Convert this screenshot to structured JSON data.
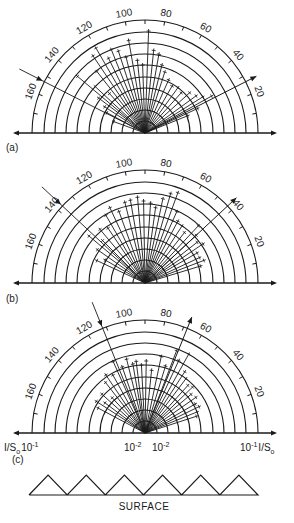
{
  "figure": {
    "panels": [
      {
        "id": "a",
        "label": "(a)",
        "center": [
          145,
          133
        ],
        "incident_angle_deg": 153,
        "specular_angle_deg": 27,
        "rays": [
          [
            160,
            35
          ],
          [
            152,
            45
          ],
          [
            147,
            50
          ],
          [
            143,
            60
          ],
          [
            140,
            90
          ],
          [
            137,
            70
          ],
          [
            132,
            55
          ],
          [
            128,
            80
          ],
          [
            124,
            95
          ],
          [
            120,
            100
          ],
          [
            116,
            85
          ],
          [
            112,
            92
          ],
          [
            108,
            88
          ],
          [
            104,
            80
          ],
          [
            100,
            96
          ],
          [
            96,
            75
          ],
          [
            92,
            70
          ],
          [
            88,
            104
          ],
          [
            84,
            85
          ],
          [
            80,
            82
          ],
          [
            76,
            72
          ],
          [
            72,
            66
          ],
          [
            66,
            60
          ],
          [
            60,
            56
          ],
          [
            54,
            58
          ],
          [
            48,
            56
          ],
          [
            42,
            62
          ],
          [
            36,
            65
          ],
          [
            32,
            70
          ],
          [
            29,
            78
          ],
          [
            25,
            60
          ],
          [
            22,
            48
          ]
        ]
      },
      {
        "id": "b",
        "label": "(b)",
        "center": [
          145,
          283
        ],
        "incident_angle_deg": 137,
        "specular_angle_deg": 43,
        "rays": [
          [
            155,
            55
          ],
          [
            150,
            48
          ],
          [
            145,
            60
          ],
          [
            140,
            75
          ],
          [
            135,
            62
          ],
          [
            130,
            72
          ],
          [
            124,
            68
          ],
          [
            120,
            80
          ],
          [
            115,
            85
          ],
          [
            110,
            78
          ],
          [
            104,
            85
          ],
          [
            100,
            86
          ],
          [
            95,
            88
          ],
          [
            91,
            84
          ],
          [
            86,
            82
          ],
          [
            82,
            78
          ],
          [
            78,
            88
          ],
          [
            74,
            95
          ],
          [
            70,
            98
          ],
          [
            66,
            80
          ],
          [
            62,
            72
          ],
          [
            57,
            70
          ],
          [
            52,
            66
          ],
          [
            47,
            80
          ],
          [
            43,
            72
          ],
          [
            38,
            68
          ],
          [
            34,
            72
          ],
          [
            30,
            62
          ],
          [
            25,
            62
          ],
          [
            21,
            65
          ],
          [
            17,
            60
          ]
        ]
      },
      {
        "id": "c",
        "label": "(c)",
        "center": [
          145,
          433
        ],
        "incident_angle_deg": 112,
        "specular_angle_deg": 68,
        "rays": [
          [
            152,
            55
          ],
          [
            147,
            60
          ],
          [
            143,
            52
          ],
          [
            138,
            60
          ],
          [
            133,
            50
          ],
          [
            128,
            66
          ],
          [
            124,
            72
          ],
          [
            119,
            68
          ],
          [
            114,
            80
          ],
          [
            109,
            72
          ],
          [
            104,
            78
          ],
          [
            100,
            72
          ],
          [
            97,
            74
          ],
          [
            93,
            70
          ],
          [
            89,
            74
          ],
          [
            84,
            65
          ],
          [
            78,
            80
          ],
          [
            73,
            72
          ],
          [
            69,
            90
          ],
          [
            65,
            82
          ],
          [
            61,
            92
          ],
          [
            57,
            75
          ],
          [
            53,
            70
          ],
          [
            48,
            66
          ],
          [
            44,
            68
          ],
          [
            40,
            62
          ],
          [
            35,
            64
          ],
          [
            30,
            60
          ],
          [
            26,
            62
          ],
          [
            22,
            58
          ],
          [
            18,
            56
          ]
        ]
      }
    ],
    "grid": {
      "ring_radii": [
        12,
        23,
        34,
        45,
        56,
        68,
        79,
        90,
        101,
        113
      ],
      "outer_radius": 113,
      "axis_half_length": 130,
      "tick_step_deg": 10,
      "angle_labels": [
        "160",
        "140",
        "120",
        "100",
        "80",
        "60",
        "40",
        "20"
      ],
      "angle_label_values": [
        160,
        140,
        120,
        100,
        80,
        60,
        40,
        20
      ]
    },
    "axis_labels_c": {
      "left_unit": "I/S",
      "left_unit_sub": "o",
      "left_value": "10",
      "left_exp": "-1",
      "center_left_value": "10",
      "center_left_exp": "-2",
      "center_right_value": "10",
      "center_right_exp": "-2",
      "right_value": "10",
      "right_exp": "-1",
      "right_unit": "I/S",
      "right_unit_sub": "o"
    },
    "surface": {
      "label": "SURFACE",
      "teeth": 6,
      "x_start": 29,
      "x_end": 258,
      "baseline_y": 495,
      "apex_y": 475
    },
    "colors": {
      "ink": "#1a1a1a",
      "background": "#ffffff"
    }
  }
}
